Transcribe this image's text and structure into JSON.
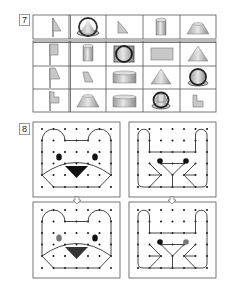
{
  "exercise7": {
    "number": "7",
    "header_row": [
      "flag-triangle",
      "cone-top-view-shape",
      "right-triangle",
      "cylinder",
      "truncated-cone"
    ],
    "rows": [
      [
        "flag-rectangle",
        "cylinder",
        "cylinder-front-view",
        "rectangle",
        "cone"
      ],
      [
        "flag-trapezoid",
        "trapezoid",
        "flat-cylinder",
        "cone",
        "sphere-cap-view"
      ],
      [
        "flag-l-shape",
        "truncated-cone",
        "flat-cylinder",
        "cylinder-top-view",
        "l-shape"
      ]
    ]
  },
  "exercise8": {
    "number": "8",
    "panels": [
      {
        "name": "bear-original",
        "figure": "bear",
        "eye_colors": [
          "#111111",
          "#111111"
        ],
        "nose_color": "#111111"
      },
      {
        "name": "rabbit-original",
        "figure": "rabbit",
        "eye_colors": [
          "#111111",
          "#111111"
        ]
      },
      {
        "name": "bear-copy",
        "figure": "bear",
        "eye_colors": [
          "#777777",
          "#111111"
        ],
        "nose_color": "#333333"
      },
      {
        "name": "rabbit-copy",
        "figure": "rabbit",
        "eye_colors": [
          "#111111",
          "#777777"
        ]
      }
    ],
    "arrow_icon": "down-arrow-icon"
  },
  "colors": {
    "border": "#555555",
    "shape_fill": "#c8c8c8",
    "shape_dark": "#8a8a8a",
    "dot": "#111111"
  }
}
